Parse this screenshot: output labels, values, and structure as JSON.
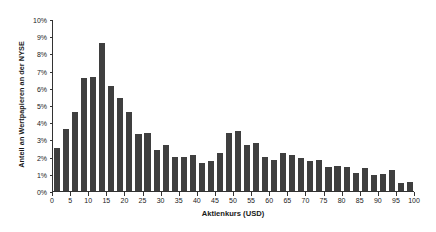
{
  "chart_data": {
    "type": "bar",
    "title": "",
    "subtitle": "",
    "xlabel": "Aktienkurs (USD)",
    "ylabel": "Anteil an Wertpapieren an der NYSE",
    "xlim": [
      0,
      100
    ],
    "ylim": [
      0,
      10
    ],
    "grid": false,
    "legend": null,
    "bar_color": "#3f3f3f",
    "bin_width": 2.5,
    "y_tick_labels": [
      "0%",
      "1%",
      "2%",
      "3%",
      "4%",
      "5%",
      "6%",
      "7%",
      "8%",
      "9%",
      "10%"
    ],
    "y_tick_values": [
      0,
      1,
      2,
      3,
      4,
      5,
      6,
      7,
      8,
      9,
      10
    ],
    "x_tick_labels": [
      "0",
      "5",
      "10",
      "15",
      "20",
      "25",
      "30",
      "35",
      "40",
      "45",
      "50",
      "55",
      "60",
      "65",
      "70",
      "75",
      "80",
      "85",
      "90",
      "95",
      "100"
    ],
    "x_tick_values": [
      0,
      5,
      10,
      15,
      20,
      25,
      30,
      35,
      40,
      45,
      50,
      55,
      60,
      65,
      70,
      75,
      80,
      85,
      90,
      95,
      100
    ],
    "categories": [
      0,
      2.5,
      5,
      7.5,
      10,
      12.5,
      15,
      17.5,
      20,
      22.5,
      25,
      27.5,
      30,
      32.5,
      35,
      37.5,
      40,
      42.5,
      45,
      47.5,
      50,
      52.5,
      55,
      57.5,
      60,
      62.5,
      65,
      67.5,
      70,
      72.5,
      75,
      77.5,
      80,
      82.5,
      85,
      87.5,
      90,
      92.5,
      95,
      97.5
    ],
    "values": [
      2.5,
      3.6,
      4.6,
      6.55,
      6.6,
      8.6,
      6.1,
      5.4,
      4.6,
      3.3,
      3.4,
      2.4,
      2.7,
      1.95,
      1.95,
      2.1,
      1.65,
      1.75,
      2.2,
      3.4,
      3.5,
      2.7,
      2.8,
      2.0,
      1.8,
      2.2,
      2.1,
      1.9,
      1.75,
      1.8,
      1.4,
      1.45,
      1.4,
      1.05,
      1.35,
      0.95,
      1.0,
      1.25,
      0.45,
      0.5
    ]
  }
}
